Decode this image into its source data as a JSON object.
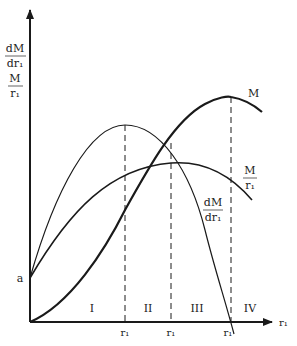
{
  "diagram": {
    "type": "economic-curve-diagram",
    "axes": {
      "x_label": "r₁",
      "y_labels": [
        {
          "num": "dM",
          "den": "dr₁"
        },
        {
          "num": "M",
          "den": "r₁"
        }
      ],
      "intercept_label": "a"
    },
    "curves": [
      {
        "id": "total",
        "label": "M",
        "weight": "thick"
      },
      {
        "id": "average",
        "label_num": "M",
        "label_den": "r₁",
        "weight": "medium"
      },
      {
        "id": "marginal",
        "label_num": "dM",
        "label_den": "dr₁",
        "weight": "thin"
      }
    ],
    "regions": [
      "I",
      "II",
      "III",
      "IV"
    ],
    "tick_labels": [
      "r₁",
      "r₁",
      "r₁"
    ],
    "colors": {
      "line": "#1a1a1a",
      "background": "#ffffff"
    }
  }
}
